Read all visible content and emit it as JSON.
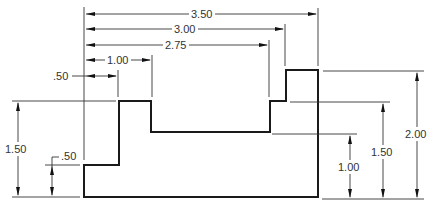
{
  "drawing": {
    "title": "Stepped block dimensioned drawing",
    "units": "in",
    "horizontal_dimensions": [
      {
        "id": "h350",
        "label": "3.50",
        "value": 3.5
      },
      {
        "id": "h300",
        "label": "3.00",
        "value": 3.0
      },
      {
        "id": "h275",
        "label": "2.75",
        "value": 2.75
      },
      {
        "id": "h100",
        "label": "1.00",
        "value": 1.0
      },
      {
        "id": "h050",
        "label": ".50",
        "value": 0.5
      }
    ],
    "vertical_dimensions_left": [
      {
        "id": "vl150",
        "label": "1.50",
        "value": 1.5
      },
      {
        "id": "vl050",
        "label": ".50",
        "value": 0.5
      }
    ],
    "vertical_dimensions_right": [
      {
        "id": "vr100",
        "label": "1.00",
        "value": 1.0
      },
      {
        "id": "vr150",
        "label": "1.50",
        "value": 1.5
      },
      {
        "id": "vr200",
        "label": "2.00",
        "value": 2.0
      }
    ],
    "colors": {
      "outline": "#1a1a1a",
      "dimension": "#333333",
      "background": "#ffffff"
    }
  }
}
